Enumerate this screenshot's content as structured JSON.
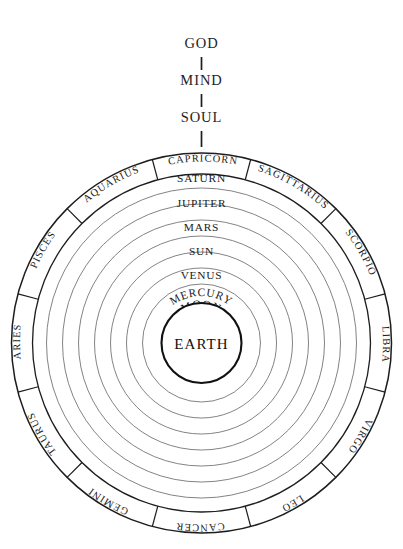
{
  "diagram": {
    "hierarchy": [
      {
        "label": "GOD"
      },
      {
        "label": "MIND"
      },
      {
        "label": "SOUL"
      }
    ],
    "center": {
      "label": "EARTH"
    },
    "spheres": [
      {
        "label": "SATURN"
      },
      {
        "label": "JUPITER"
      },
      {
        "label": "MARS"
      },
      {
        "label": "SUN"
      },
      {
        "label": "VENUS"
      },
      {
        "label": "MERCURY"
      },
      {
        "label": "MOON"
      }
    ],
    "zodiac": [
      {
        "label": "CAPRICORN"
      },
      {
        "label": "SAGITTARIUS"
      },
      {
        "label": "SCORPIO"
      },
      {
        "label": "LIBRA"
      },
      {
        "label": "VIRGO"
      },
      {
        "label": "LEO"
      },
      {
        "label": "CANCER"
      },
      {
        "label": "GEMINI"
      },
      {
        "label": "TAURUS"
      },
      {
        "label": "ARIES"
      },
      {
        "label": "PISCES"
      },
      {
        "label": "AQUARIUS"
      }
    ],
    "colors": {
      "background": "#ffffff",
      "ink": "#1a1a1a",
      "sphere_stroke": "#6d6d70",
      "ring_stroke": "#1d1d1d"
    }
  }
}
